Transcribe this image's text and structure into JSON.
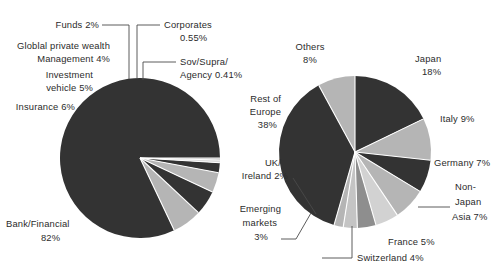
{
  "figure": {
    "background": "#ffffff",
    "text_color": "#2b2b2b",
    "dark_color": "#333333",
    "light_color": "#b5b5b5",
    "separator_color": "#ffffff"
  },
  "chart_data": [
    {
      "type": "pie",
      "title": "",
      "id": "investor-type-pie",
      "position": "left",
      "center": [
        140,
        158
      ],
      "radius": 80,
      "start_angle_deg": 0,
      "direction": "counterclockwise",
      "categories": [
        "Bank/Financial",
        "Insurance",
        "Investment vehicle",
        "Globlal private wealth Management",
        "Funds",
        "Corporates",
        "Sov/Supra/Agency"
      ],
      "values": [
        82,
        6,
        5,
        4,
        2,
        0.55,
        0.41
      ],
      "value_labels": [
        "82%",
        "6%",
        "5%",
        "4%",
        "2%",
        "0.55%",
        "0.41%"
      ],
      "slice_colors": [
        "#333333",
        "#b5b5b5",
        "#333333",
        "#b5b5b5",
        "#333333",
        "#dcdcdc",
        "#b5b5b5"
      ],
      "labels": [
        {
          "name": "bank-financial",
          "line1": "Bank/Financial",
          "line2": "82%",
          "leader": false
        },
        {
          "name": "insurance",
          "line1": "Insurance 6%",
          "line2": "",
          "leader": false
        },
        {
          "name": "investment-vehicle",
          "line1": "Investment",
          "line2": "vehicle 5%",
          "leader": false
        },
        {
          "name": "global-private-wealth-management",
          "line1": "Globlal private wealth",
          "line2": "Management 4%",
          "leader": false
        },
        {
          "name": "funds",
          "line1": "Funds 2%",
          "line2": "",
          "leader": true
        },
        {
          "name": "corporates",
          "line1": "Corporates",
          "line2": "0.55%",
          "leader": true
        },
        {
          "name": "sov-supra-agency",
          "line1": "Sov/Supra/",
          "line2": "Agency 0.41%",
          "leader": true
        }
      ],
      "legend": "none",
      "grid": false
    },
    {
      "type": "pie",
      "title": "",
      "id": "geography-pie",
      "position": "right",
      "center": [
        355,
        152
      ],
      "radius": 76,
      "start_angle_deg": 90,
      "direction": "clockwise",
      "categories": [
        "Japan",
        "Italy",
        "Germany",
        "Non-Japan Asia",
        "France",
        "Switzerland",
        "Emerging markets",
        "UK/Ireland",
        "Rest of Europe",
        "Others"
      ],
      "values": [
        18,
        9,
        7,
        7,
        5,
        4,
        3,
        2,
        38,
        8
      ],
      "value_labels": [
        "18%",
        "9%",
        "7%",
        "7%",
        "5%",
        "4%",
        "3%",
        "2%",
        "38%",
        "8%"
      ],
      "slice_colors": [
        "#333333",
        "#b5b5b5",
        "#333333",
        "#b5b5b5",
        "#d2d2d2",
        "#8e8e8e",
        "#c4c4c4",
        "#b5b5b5",
        "#333333",
        "#b5b5b5"
      ],
      "labels": [
        {
          "name": "japan",
          "line1": "Japan",
          "line2": "18%",
          "leader": false
        },
        {
          "name": "italy",
          "line1": "Italy 9%",
          "line2": "",
          "leader": false
        },
        {
          "name": "germany",
          "line1": "Germany  7%",
          "line2": "",
          "leader": false
        },
        {
          "name": "non-japan-asia",
          "line1": "Non-",
          "line2": "Japan",
          "line3": "Asia 7%",
          "leader": true
        },
        {
          "name": "france",
          "line1": "France 5%",
          "line2": "",
          "leader": false
        },
        {
          "name": "switzerland",
          "line1": "Switzerland 4%",
          "line2": "",
          "leader": true
        },
        {
          "name": "emerging-markets",
          "line1": "Emerging",
          "line2": "markets",
          "line3": "3%",
          "leader": true
        },
        {
          "name": "uk-ireland",
          "line1": "UK/",
          "line2": "Ireland 2%",
          "leader": true
        },
        {
          "name": "rest-of-europe",
          "line1": "Rest of",
          "line2": "Europe",
          "line3": "38%",
          "leader": false
        },
        {
          "name": "others",
          "line1": "Others",
          "line2": "8%",
          "leader": false
        }
      ],
      "legend": "none",
      "grid": false
    }
  ],
  "left_chart_labels": {
    "funds_l1": "Funds 2%",
    "corporates_l1": "Corporates",
    "corporates_l2": "0.55%",
    "gpwm_l1": "Globlal private wealth",
    "gpwm_l2": "Management 4%",
    "sov_l1": "Sov/Supra/",
    "sov_l2": "Agency 0.41%",
    "invveh_l1": "Investment",
    "invveh_l2": "vehicle 5%",
    "insurance_l1": "Insurance 6%",
    "bank_l1": "Bank/Financial",
    "bank_l2": "82%"
  },
  "right_chart_labels": {
    "others_l1": "Others",
    "others_l2": "8%",
    "japan_l1": "Japan",
    "japan_l2": "18%",
    "resteurope_l1": "Rest of",
    "resteurope_l2": "Europe",
    "resteurope_l3": "38%",
    "italy_l1": "Italy 9%",
    "germany_l1": "Germany  7%",
    "nonjapan_l1": "Non-",
    "nonjapan_l2": "Japan",
    "nonjapan_l3": "Asia 7%",
    "uk_l1": "UK/",
    "uk_l2": "Ireland 2%",
    "emerging_l1": "Emerging",
    "emerging_l2": "markets",
    "emerging_l3": "3%",
    "france_l1": "France 5%",
    "switzerland_l1": "Switzerland 4%"
  }
}
